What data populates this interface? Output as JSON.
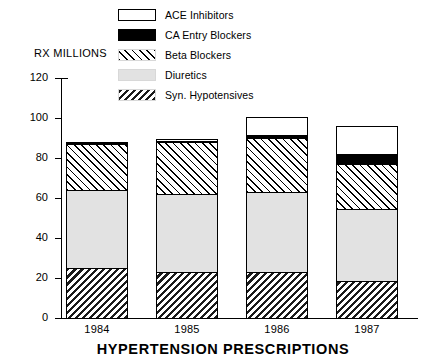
{
  "chart_data": {
    "type": "bar",
    "subtype": "stacked-bar",
    "title": "HYPERTENSION PRESCRIPTIONS",
    "xlabel": "",
    "ylabel": "RX MILLIONS",
    "ylim": [
      0,
      120
    ],
    "yticks": [
      0,
      20,
      40,
      60,
      80,
      100,
      120
    ],
    "ytick_labels": [
      "0",
      "20",
      "40",
      "60",
      "80",
      "100",
      "120"
    ],
    "grid": false,
    "legend_position": "top-center",
    "categories": [
      "1984",
      "1985",
      "1986",
      "1987"
    ],
    "series": [
      {
        "name": "Syn. Hypotensives",
        "values": [
          25,
          23,
          23,
          18.5
        ],
        "pattern": "back-hatch",
        "color": "#000000"
      },
      {
        "name": "Diuretics",
        "values": [
          39,
          39,
          40,
          36
        ],
        "pattern": "solid-light-gray",
        "color": "#e2e2e2"
      },
      {
        "name": "Beta Blockers",
        "values": [
          23,
          26,
          27,
          22.5
        ],
        "pattern": "forward-hatch",
        "color": "#000000"
      },
      {
        "name": "CA Entry Blockers",
        "values": [
          0.5,
          0.5,
          1.5,
          5
        ],
        "pattern": "solid-black",
        "color": "#000000"
      },
      {
        "name": "ACE Inhibitors",
        "values": [
          0.5,
          1,
          9,
          14
        ],
        "pattern": "solid-white",
        "color": "#ffffff"
      }
    ],
    "totals": [
      88,
      89,
      101,
      96
    ]
  },
  "legend": {
    "items": [
      {
        "label": "ACE Inhibitors",
        "swatch": "ace-inhibitors-swatch"
      },
      {
        "label": "CA Entry Blockers",
        "swatch": "ca-entry-blockers-swatch"
      },
      {
        "label": "Beta Blockers",
        "swatch": "beta-blockers-swatch"
      },
      {
        "label": "Diuretics",
        "swatch": "diuretics-swatch"
      },
      {
        "label": "Syn. Hypotensives",
        "swatch": "syn-hypotensives-swatch"
      }
    ]
  },
  "axis": {
    "y_title": "RX MILLIONS",
    "y_ticks": [
      "120",
      "100",
      "80",
      "60",
      "40",
      "20",
      "0"
    ],
    "x_ticks": [
      "1984",
      "1985",
      "1986",
      "1987"
    ]
  },
  "figure": {
    "title": "HYPERTENSION PRESCRIPTIONS"
  }
}
